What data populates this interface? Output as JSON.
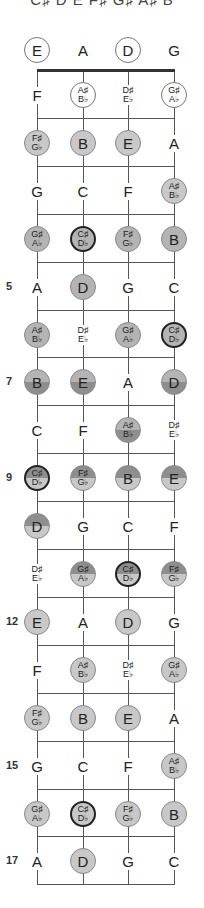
{
  "header": {
    "scale_notes": "C♯ D E F♯ G♯ A♯ B"
  },
  "strings": [
    "E",
    "A",
    "D",
    "G"
  ],
  "colors": {
    "outline_only": "#ffffff",
    "light": "#c8c8c8",
    "medium": "#b4b4b4",
    "dark": "#8e8e8e",
    "ring_border": "#222222"
  },
  "fret_markers": [
    {
      "fret": 5,
      "label": "5"
    },
    {
      "fret": 7,
      "label": "7"
    },
    {
      "fret": 9,
      "label": "9"
    },
    {
      "fret": 12,
      "label": "12"
    },
    {
      "fret": 15,
      "label": "15"
    },
    {
      "fret": 17,
      "label": "17"
    }
  ],
  "rows": [
    {
      "fret": 0,
      "notes": [
        {
          "top": "E",
          "style": "outline"
        },
        {
          "top": "A",
          "style": "none"
        },
        {
          "top": "D",
          "style": "outline"
        },
        {
          "top": "G",
          "style": "none"
        }
      ]
    },
    {
      "fret": 1,
      "notes": [
        {
          "top": "F",
          "style": "none"
        },
        {
          "top": "A♯",
          "bottom": "B♭",
          "style": "outline"
        },
        {
          "top": "D♯",
          "bottom": "E♭",
          "style": "none"
        },
        {
          "top": "G♯",
          "bottom": "A♭",
          "style": "outline"
        }
      ]
    },
    {
      "fret": 2,
      "notes": [
        {
          "top": "F♯",
          "bottom": "G♭",
          "style": "light"
        },
        {
          "top": "B",
          "style": "light"
        },
        {
          "top": "E",
          "style": "light"
        },
        {
          "top": "A",
          "style": "none"
        }
      ]
    },
    {
      "fret": 3,
      "notes": [
        {
          "top": "G",
          "style": "none"
        },
        {
          "top": "C",
          "style": "none"
        },
        {
          "top": "F",
          "style": "none"
        },
        {
          "top": "A♯",
          "bottom": "B♭",
          "style": "light"
        }
      ]
    },
    {
      "fret": 4,
      "notes": [
        {
          "top": "G♯",
          "bottom": "A♭",
          "style": "medium"
        },
        {
          "top": "C♯",
          "bottom": "D♭",
          "style": "medium-ring"
        },
        {
          "top": "F♯",
          "bottom": "G♭",
          "style": "medium"
        },
        {
          "top": "B",
          "style": "medium"
        }
      ]
    },
    {
      "fret": 5,
      "notes": [
        {
          "top": "A",
          "style": "none"
        },
        {
          "top": "D",
          "style": "medium"
        },
        {
          "top": "G",
          "style": "none"
        },
        {
          "top": "C",
          "style": "none"
        }
      ]
    },
    {
      "fret": 6,
      "notes": [
        {
          "top": "A♯",
          "bottom": "B♭",
          "style": "medium"
        },
        {
          "top": "D♯",
          "bottom": "E♭",
          "style": "none"
        },
        {
          "top": "G♯",
          "bottom": "A♭",
          "style": "medium"
        },
        {
          "top": "C♯",
          "bottom": "D♭",
          "style": "medium-ring"
        }
      ]
    },
    {
      "fret": 7,
      "notes": [
        {
          "top": "B",
          "style": "split-light-top"
        },
        {
          "top": "E",
          "style": "split-light-top"
        },
        {
          "top": "A",
          "style": "none"
        },
        {
          "top": "D",
          "style": "split-light-top"
        }
      ]
    },
    {
      "fret": 8,
      "notes": [
        {
          "top": "C",
          "style": "none"
        },
        {
          "top": "F",
          "style": "none"
        },
        {
          "top": "A♯",
          "bottom": "B♭",
          "style": "split-light-top"
        },
        {
          "top": "D♯",
          "bottom": "E♭",
          "style": "none"
        }
      ]
    },
    {
      "fret": 9,
      "notes": [
        {
          "top": "C♯",
          "bottom": "D♭",
          "style": "split-dark-top-ring"
        },
        {
          "top": "F♯",
          "bottom": "G♭",
          "style": "split-dark-top"
        },
        {
          "top": "B",
          "style": "split-dark-top"
        },
        {
          "top": "E",
          "style": "split-dark-top"
        }
      ]
    },
    {
      "fret": 10,
      "notes": [
        {
          "top": "D",
          "style": "split-dark-top"
        },
        {
          "top": "G",
          "style": "none"
        },
        {
          "top": "C",
          "style": "none"
        },
        {
          "top": "F",
          "style": "none"
        }
      ]
    },
    {
      "fret": 11,
      "notes": [
        {
          "top": "D♯",
          "bottom": "E♭",
          "style": "none"
        },
        {
          "top": "G♯",
          "bottom": "A♭",
          "style": "split-dark-top"
        },
        {
          "top": "C♯",
          "bottom": "D♭",
          "style": "split-dark-top-ring"
        },
        {
          "top": "F♯",
          "bottom": "G♭",
          "style": "split-dark-top"
        }
      ]
    },
    {
      "fret": 12,
      "notes": [
        {
          "top": "E",
          "style": "light"
        },
        {
          "top": "A",
          "style": "none"
        },
        {
          "top": "D",
          "style": "light"
        },
        {
          "top": "G",
          "style": "none"
        }
      ]
    },
    {
      "fret": 13,
      "notes": [
        {
          "top": "F",
          "style": "none"
        },
        {
          "top": "A♯",
          "bottom": "B♭",
          "style": "light"
        },
        {
          "top": "D♯",
          "bottom": "E♭",
          "style": "none"
        },
        {
          "top": "G♯",
          "bottom": "A♭",
          "style": "light"
        }
      ]
    },
    {
      "fret": 14,
      "notes": [
        {
          "top": "F♯",
          "bottom": "G♭",
          "style": "light"
        },
        {
          "top": "B",
          "style": "light"
        },
        {
          "top": "E",
          "style": "light"
        },
        {
          "top": "A",
          "style": "none"
        }
      ]
    },
    {
      "fret": 15,
      "notes": [
        {
          "top": "G",
          "style": "none"
        },
        {
          "top": "C",
          "style": "none"
        },
        {
          "top": "F",
          "style": "none"
        },
        {
          "top": "A♯",
          "bottom": "B♭",
          "style": "light"
        }
      ]
    },
    {
      "fret": 16,
      "notes": [
        {
          "top": "G♯",
          "bottom": "A♭",
          "style": "light"
        },
        {
          "top": "C♯",
          "bottom": "D♭",
          "style": "light-ring"
        },
        {
          "top": "F♯",
          "bottom": "G♭",
          "style": "light"
        },
        {
          "top": "B",
          "style": "light"
        }
      ]
    },
    {
      "fret": 17,
      "notes": [
        {
          "top": "A",
          "style": "none"
        },
        {
          "top": "D",
          "style": "light"
        },
        {
          "top": "G",
          "style": "none"
        },
        {
          "top": "C",
          "style": "none"
        }
      ]
    }
  ]
}
